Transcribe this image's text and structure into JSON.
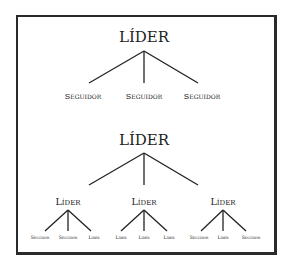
{
  "diagram1": {
    "root": "LÍDER",
    "children": [
      "Seguidor",
      "Seguidor",
      "Seguidor"
    ]
  },
  "diagram2": {
    "root": "LÍDER",
    "groups": [
      {
        "label": "Líder",
        "children": [
          "Seguidor",
          "Seguidor",
          "Líder"
        ]
      },
      {
        "label": "Líder",
        "children": [
          "Líder",
          "Líder",
          "Líder"
        ]
      },
      {
        "label": "Líder",
        "children": [
          "Seguidor",
          "Líder",
          "Seguidor"
        ]
      }
    ]
  }
}
